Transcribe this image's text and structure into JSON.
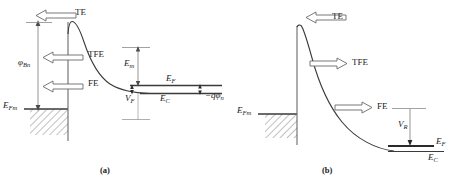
{
  "figure": {
    "type": "schottky-barrier-band-diagram",
    "stroke_color": "#3a3a3a",
    "text_color": "#1a1a1a"
  },
  "panels": [
    {
      "id": "a",
      "caption": "(a)",
      "bias": "forward",
      "arrow_direction": "left",
      "transport_mechanisms": [
        {
          "label": "TE",
          "name": "thermionic-emission"
        },
        {
          "label": "TFE",
          "name": "thermionic-field-emission"
        },
        {
          "label": "FE",
          "name": "field-emission"
        }
      ],
      "energy_labels": [
        {
          "text": "φ",
          "sub": "Bn",
          "name": "barrier-height"
        },
        {
          "text": "E",
          "sub": "Fm",
          "name": "metal-fermi-level"
        },
        {
          "text": "E",
          "sub": "m",
          "name": "em-level"
        },
        {
          "text": "E",
          "sub": "F",
          "name": "semiconductor-fermi-level"
        },
        {
          "text": "E",
          "sub": "C",
          "name": "conduction-band-edge"
        },
        {
          "text": "V",
          "sub": "F",
          "name": "forward-voltage"
        },
        {
          "text": "−qφ",
          "sub": "n",
          "name": "qphi-n"
        }
      ]
    },
    {
      "id": "b",
      "caption": "(b)",
      "bias": "reverse",
      "arrow_direction": "right",
      "transport_mechanisms": [
        {
          "label": "TE",
          "name": "thermionic-emission"
        },
        {
          "label": "TFE",
          "name": "thermionic-field-emission"
        },
        {
          "label": "FE",
          "name": "field-emission"
        }
      ],
      "energy_labels": [
        {
          "text": "E",
          "sub": "Fm",
          "name": "metal-fermi-level"
        },
        {
          "text": "V",
          "sub": "R",
          "name": "reverse-voltage"
        },
        {
          "text": "E",
          "sub": "F",
          "name": "semiconductor-fermi-level"
        },
        {
          "text": "E",
          "sub": "C",
          "name": "conduction-band-edge"
        }
      ]
    }
  ],
  "text": {
    "a": {
      "te": "TE",
      "tfe": "TFE",
      "fe": "FE",
      "phiBn_main": "φ",
      "phiBn_sub": "Bn",
      "eFm_main": "E",
      "eFm_sub": "Fm",
      "em_main": "E",
      "em_sub": "m",
      "eF_main": "E",
      "eF_sub": "F",
      "eC_main": "E",
      "eC_sub": "C",
      "vF_main": "V",
      "vF_sub": "F",
      "qphin_main": "−qφ",
      "qphin_sub": "n",
      "caption": "(a)"
    },
    "b": {
      "te": "TE",
      "tfe": "TFE",
      "fe": "FE",
      "eFm_main": "E",
      "eFm_sub": "Fm",
      "vR_main": "V",
      "vR_sub": "R",
      "eF_main": "E",
      "eF_sub": "F",
      "eC_main": "E",
      "eC_sub": "C",
      "caption": "(b)"
    }
  }
}
